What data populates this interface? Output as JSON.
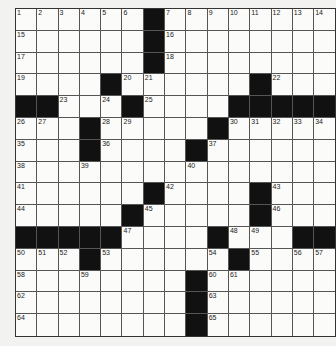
{
  "puzzle": {
    "rows": 15,
    "cols": 15,
    "colors": {
      "black": "#111111",
      "white": "#fbfbf9",
      "line": "#555555"
    },
    "grid": [
      "111111#11111111",
      "111111#11111111",
      "111111#11111111",
      "1111#1111111#111",
      "##111#1111#####",
      "111#111111#11111",
      "111#11111#111111",
      "111111111111111",
      "111111#11111#111",
      "11111#111111#111",
      "#####1111#11##",
      "111#111111#1111",
      "11111111#111111",
      "11111111#111111",
      "11111111#111111"
    ],
    "black_cells": [
      [
        1,
        7
      ],
      [
        2,
        7
      ],
      [
        3,
        7
      ],
      [
        4,
        5
      ],
      [
        4,
        12
      ],
      [
        5,
        1
      ],
      [
        5,
        2
      ],
      [
        5,
        6
      ],
      [
        5,
        11
      ],
      [
        5,
        12
      ],
      [
        5,
        13
      ],
      [
        5,
        14
      ],
      [
        5,
        15
      ],
      [
        6,
        4
      ],
      [
        6,
        10
      ],
      [
        7,
        4
      ],
      [
        7,
        9
      ],
      [
        9,
        7
      ],
      [
        9,
        12
      ],
      [
        10,
        6
      ],
      [
        10,
        12
      ],
      [
        11,
        1
      ],
      [
        11,
        2
      ],
      [
        11,
        3
      ],
      [
        11,
        4
      ],
      [
        11,
        5
      ],
      [
        11,
        10
      ],
      [
        11,
        14
      ],
      [
        11,
        15
      ],
      [
        12,
        4
      ],
      [
        12,
        11
      ],
      [
        13,
        9
      ],
      [
        14,
        9
      ],
      [
        15,
        9
      ]
    ],
    "numbers": [
      {
        "n": "1",
        "r": 1,
        "c": 1
      },
      {
        "n": "2",
        "r": 1,
        "c": 2
      },
      {
        "n": "3",
        "r": 1,
        "c": 3
      },
      {
        "n": "4",
        "r": 1,
        "c": 4
      },
      {
        "n": "5",
        "r": 1,
        "c": 5
      },
      {
        "n": "6",
        "r": 1,
        "c": 6
      },
      {
        "n": "7",
        "r": 1,
        "c": 8
      },
      {
        "n": "8",
        "r": 1,
        "c": 9
      },
      {
        "n": "9",
        "r": 1,
        "c": 10
      },
      {
        "n": "10",
        "r": 1,
        "c": 11
      },
      {
        "n": "11",
        "r": 1,
        "c": 12
      },
      {
        "n": "12",
        "r": 1,
        "c": 13
      },
      {
        "n": "13",
        "r": 1,
        "c": 14
      },
      {
        "n": "14",
        "r": 1,
        "c": 15
      },
      {
        "n": "15",
        "r": 2,
        "c": 1
      },
      {
        "n": "16",
        "r": 2,
        "c": 8
      },
      {
        "n": "17",
        "r": 3,
        "c": 1
      },
      {
        "n": "18",
        "r": 3,
        "c": 8
      },
      {
        "n": "19",
        "r": 4,
        "c": 1
      },
      {
        "n": "20",
        "r": 4,
        "c": 6
      },
      {
        "n": "21",
        "r": 4,
        "c": 7
      },
      {
        "n": "22",
        "r": 4,
        "c": 13
      },
      {
        "n": "23",
        "r": 5,
        "c": 3
      },
      {
        "n": "24",
        "r": 5,
        "c": 5
      },
      {
        "n": "25",
        "r": 5,
        "c": 7
      },
      {
        "n": "26",
        "r": 6,
        "c": 1
      },
      {
        "n": "27",
        "r": 6,
        "c": 2
      },
      {
        "n": "28",
        "r": 6,
        "c": 5
      },
      {
        "n": "29",
        "r": 6,
        "c": 6
      },
      {
        "n": "30",
        "r": 6,
        "c": 11
      },
      {
        "n": "31",
        "r": 6,
        "c": 12
      },
      {
        "n": "32",
        "r": 6,
        "c": 13
      },
      {
        "n": "33",
        "r": 6,
        "c": 14
      },
      {
        "n": "34",
        "r": 6,
        "c": 15
      },
      {
        "n": "35",
        "r": 7,
        "c": 1
      },
      {
        "n": "36",
        "r": 7,
        "c": 5
      },
      {
        "n": "37",
        "r": 7,
        "c": 10
      },
      {
        "n": "38",
        "r": 8,
        "c": 1
      },
      {
        "n": "39",
        "r": 8,
        "c": 4
      },
      {
        "n": "40",
        "r": 8,
        "c": 9
      },
      {
        "n": "41",
        "r": 9,
        "c": 1
      },
      {
        "n": "42",
        "r": 9,
        "c": 8
      },
      {
        "n": "43",
        "r": 9,
        "c": 13
      },
      {
        "n": "44",
        "r": 10,
        "c": 1
      },
      {
        "n": "45",
        "r": 10,
        "c": 7
      },
      {
        "n": "46",
        "r": 10,
        "c": 13
      },
      {
        "n": "47",
        "r": 11,
        "c": 6
      },
      {
        "n": "48",
        "r": 11,
        "c": 11
      },
      {
        "n": "49",
        "r": 11,
        "c": 12
      },
      {
        "n": "50",
        "r": 12,
        "c": 1
      },
      {
        "n": "51",
        "r": 12,
        "c": 2
      },
      {
        "n": "52",
        "r": 12,
        "c": 3
      },
      {
        "n": "53",
        "r": 12,
        "c": 5
      },
      {
        "n": "54",
        "r": 12,
        "c": 10
      },
      {
        "n": "55",
        "r": 12,
        "c": 12
      },
      {
        "n": "56",
        "r": 12,
        "c": 14
      },
      {
        "n": "57",
        "r": 12,
        "c": 15
      },
      {
        "n": "58",
        "r": 13,
        "c": 1
      },
      {
        "n": "59",
        "r": 13,
        "c": 4
      },
      {
        "n": "60",
        "r": 13,
        "c": 10
      },
      {
        "n": "61",
        "r": 13,
        "c": 11
      },
      {
        "n": "62",
        "r": 14,
        "c": 1
      },
      {
        "n": "63",
        "r": 14,
        "c": 10
      },
      {
        "n": "64",
        "r": 15,
        "c": 1
      },
      {
        "n": "65",
        "r": 15,
        "c": 10
      }
    ]
  }
}
